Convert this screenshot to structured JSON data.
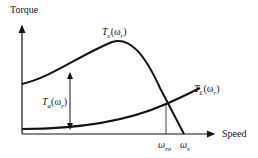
{
  "diagram": {
    "y_axis_label": "Torque",
    "x_axis_label": "Speed",
    "curves": [
      {
        "name": "electromagnetic-torque",
        "label_main": "T",
        "label_sub": "e",
        "label_arg": "(ω",
        "label_arg_sub": "r",
        "label_close": ")"
      },
      {
        "name": "load-torque",
        "label_main": "T",
        "label_sub": "L",
        "label_arg": "(ω",
        "label_arg_sub": "r",
        "label_close": ")"
      },
      {
        "name": "accelerating-torque",
        "label_main": "T",
        "label_sub": "a",
        "label_arg": "(ω",
        "label_arg_sub": "r",
        "label_close": ")"
      }
    ],
    "x_ticks": [
      {
        "main": "ω",
        "sub": "ro"
      },
      {
        "main": "ω",
        "sub": "s"
      }
    ]
  }
}
